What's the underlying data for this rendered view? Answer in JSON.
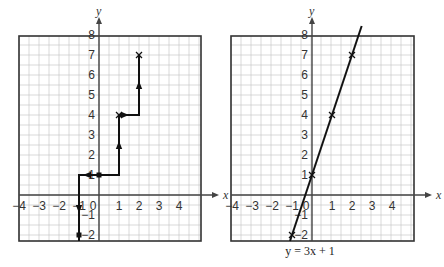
{
  "colors": {
    "background": "#ffffff",
    "grid_minor": "#c8c8c8",
    "frame": "#333333",
    "axis": "#444444",
    "ink": "#111111",
    "text": "#333333"
  },
  "graphs": [
    {
      "id": "left",
      "title": "",
      "axis_labels": {
        "x": "x",
        "y": "y"
      },
      "x_ticks": [
        "−4",
        "−3",
        "−2",
        "−1",
        "0",
        "1",
        "2",
        "3",
        "4"
      ],
      "y_ticks_positive": [
        "1",
        "2",
        "3",
        "4",
        "5",
        "6",
        "7",
        "8"
      ],
      "y_ticks_negative": [
        "−1",
        "−2"
      ],
      "description": "Slope staircase from y-intercept (0,1): right 1 up 3 twice, and left 1 down 3",
      "path_points": [
        [
          -1,
          -2.3
        ],
        [
          -1,
          1
        ],
        [
          1,
          1
        ],
        [
          1,
          4
        ],
        [
          2,
          4
        ],
        [
          2,
          7
        ]
      ],
      "markers": [
        {
          "type": "square-dot",
          "x": 0,
          "y": 1
        },
        {
          "type": "cross",
          "x": 2,
          "y": 7
        },
        {
          "type": "cross",
          "x": 1,
          "y": 4
        },
        {
          "type": "square-dot",
          "x": -1,
          "y": -2
        }
      ],
      "arrows": [
        {
          "x": 1,
          "y": 2.5,
          "dir": "up"
        },
        {
          "x": 2,
          "y": 5.5,
          "dir": "up"
        },
        {
          "x": 1.3,
          "y": 4,
          "dir": "right"
        },
        {
          "x": -0.6,
          "y": 1,
          "dir": "left"
        },
        {
          "x": -1,
          "y": -0.7,
          "dir": "down"
        }
      ]
    },
    {
      "id": "right",
      "title": "",
      "axis_labels": {
        "x": "x",
        "y": "y"
      },
      "x_ticks": [
        "−4",
        "−3",
        "−2",
        "−1",
        "0",
        "1",
        "2",
        "3",
        "4"
      ],
      "y_ticks_positive": [
        "1",
        "2",
        "3",
        "4",
        "5",
        "6",
        "7",
        "8"
      ],
      "y_ticks_negative": [
        "−1",
        "−2"
      ],
      "line": {
        "equation": "y = 3x + 1",
        "slope": 3,
        "intercept": 1
      },
      "markers": [
        {
          "type": "cross",
          "x": -1,
          "y": -2
        },
        {
          "type": "cross",
          "x": 0,
          "y": 1
        },
        {
          "type": "cross",
          "x": 1,
          "y": 4
        },
        {
          "type": "cross",
          "x": 2,
          "y": 7
        }
      ],
      "caption": "y = 3x + 1"
    }
  ],
  "chart_data": [
    {
      "type": "line",
      "title": "",
      "xlabel": "x",
      "ylabel": "y",
      "xlim": [
        -4,
        5
      ],
      "ylim": [
        -2.3,
        8
      ],
      "grid": true,
      "series": [
        {
          "name": "slope steps from (0,1)",
          "x": [
            -1,
            -1,
            0,
            1,
            1,
            2,
            2
          ],
          "y": [
            -2,
            1,
            1,
            1,
            4,
            4,
            7
          ]
        }
      ],
      "points": [
        [
          0,
          1
        ],
        [
          1,
          4
        ],
        [
          2,
          7
        ],
        [
          -1,
          -2
        ]
      ]
    },
    {
      "type": "line",
      "title": "y = 3x + 1",
      "xlabel": "x",
      "ylabel": "y",
      "xlim": [
        -4,
        5
      ],
      "ylim": [
        -2.3,
        8
      ],
      "grid": true,
      "series": [
        {
          "name": "y = 3x + 1",
          "x": [
            -1.1,
            0,
            1,
            2,
            2.5
          ],
          "y": [
            -2.3,
            1,
            4,
            7,
            8.5
          ]
        }
      ],
      "points": [
        [
          -1,
          -2
        ],
        [
          0,
          1
        ],
        [
          1,
          4
        ],
        [
          2,
          7
        ]
      ]
    }
  ]
}
